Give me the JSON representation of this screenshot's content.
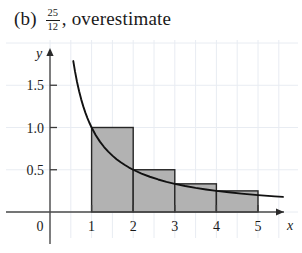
{
  "caption": {
    "part_label": "(b)",
    "fraction_numerator": "25",
    "fraction_denominator": "12",
    "estimate_text": ", overestimate"
  },
  "chart_data": {
    "type": "bar",
    "title": "",
    "subtitle": "",
    "xlabel": "x",
    "ylabel": "y",
    "xlim": [
      0,
      5.6
    ],
    "ylim": [
      0,
      1.85
    ],
    "grid": true,
    "grid_color": "#e8ecf2",
    "grid_spacing": 0.5,
    "legend": "none",
    "origin_label": "0",
    "x_ticks": [
      1,
      2,
      3,
      4,
      5
    ],
    "x_tick_labels": [
      "1",
      "2",
      "3",
      "4",
      "5"
    ],
    "y_ticks": [
      0.5,
      1.0,
      1.5
    ],
    "y_tick_labels": [
      "0.5",
      "1.0",
      "1.5"
    ],
    "bar_fill": "#b2b2b2",
    "bar_edge": "#262626",
    "curve_color": "#111111",
    "curve_label": "y = 1/x",
    "categories": [
      "[1,2]",
      "[2,3]",
      "[3,4]",
      "[4,5]"
    ],
    "bar_left_edges": [
      1,
      2,
      3,
      4
    ],
    "bar_width": 1,
    "values": [
      1,
      0.5,
      0.3333,
      0.25
    ],
    "value_labels": [
      "1",
      "1/2",
      "1/3",
      "1/4"
    ],
    "sum_of_areas": "25/12",
    "curve_x": [
      0.56,
      0.6,
      0.65,
      0.7,
      0.75,
      0.8,
      0.85,
      0.9,
      0.95,
      1.0,
      1.1,
      1.2,
      1.3,
      1.4,
      1.5,
      1.6,
      1.7,
      1.8,
      1.9,
      2.0,
      2.2,
      2.4,
      2.6,
      2.8,
      3.0,
      3.25,
      3.5,
      3.75,
      4.0,
      4.3,
      4.6,
      5.0,
      5.4,
      5.6
    ],
    "curve_y": [
      1.786,
      1.667,
      1.538,
      1.429,
      1.333,
      1.25,
      1.176,
      1.111,
      1.053,
      1.0,
      0.909,
      0.833,
      0.769,
      0.714,
      0.667,
      0.625,
      0.588,
      0.556,
      0.526,
      0.5,
      0.455,
      0.417,
      0.385,
      0.357,
      0.333,
      0.308,
      0.286,
      0.267,
      0.25,
      0.233,
      0.217,
      0.2,
      0.185,
      0.179
    ]
  }
}
